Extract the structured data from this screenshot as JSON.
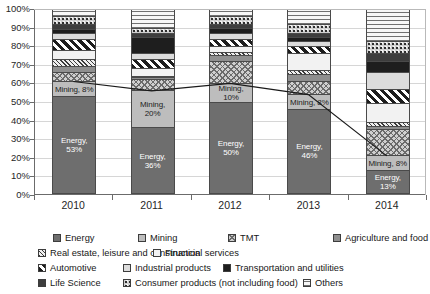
{
  "chart_data": {
    "type": "bar",
    "subtype": "100% stacked bar with trend line overlay",
    "title": "",
    "xlabel": "",
    "ylabel": "",
    "ylim": [
      0,
      100
    ],
    "ytick_labels": [
      "0%",
      "10%",
      "20%",
      "30%",
      "40%",
      "50%",
      "60%",
      "70%",
      "80%",
      "90%",
      "100%"
    ],
    "ytick_values": [
      0,
      10,
      20,
      30,
      40,
      50,
      60,
      70,
      80,
      90,
      100
    ],
    "grid": true,
    "legend_position": "bottom",
    "categories": [
      "2010",
      "2011",
      "2012",
      "2013",
      "2014"
    ],
    "series": [
      {
        "name": "Energy",
        "pattern": "solid-dark-gray",
        "values": [
          53,
          36,
          50,
          46,
          13
        ]
      },
      {
        "name": "Mining",
        "pattern": "solid-light-gray",
        "values": [
          8,
          20,
          10,
          8,
          8
        ]
      },
      {
        "name": "TMT",
        "pattern": "checkered",
        "values": [
          5,
          6,
          12,
          7,
          14
        ]
      },
      {
        "name": "Agriculture and food",
        "pattern": "solid-mid-gray",
        "values": [
          3,
          1,
          3,
          4,
          2
        ]
      },
      {
        "name": "Real estate, leisure and construction",
        "pattern": "diagonal-thin",
        "values": [
          4,
          1,
          2,
          2,
          2
        ]
      },
      {
        "name": "Financial services",
        "pattern": "solid-white",
        "values": [
          5,
          4,
          3,
          9,
          10
        ]
      },
      {
        "name": "Automotive",
        "pattern": "bold-diagonal-stripes",
        "values": [
          6,
          5,
          4,
          4,
          8
        ]
      },
      {
        "name": "Industrial products",
        "pattern": "solid-pale-gray",
        "values": [
          3,
          3,
          3,
          3,
          9
        ]
      },
      {
        "name": "Transportation and utilities",
        "pattern": "solid-black",
        "values": [
          2,
          9,
          3,
          2,
          6
        ]
      },
      {
        "name": "Life Science",
        "pattern": "solid-charcoal",
        "values": [
          3,
          2,
          2,
          2,
          4
        ]
      },
      {
        "name": "Consumer products (not including food)",
        "pattern": "dotted-grid",
        "values": [
          4,
          3,
          4,
          5,
          7
        ]
      },
      {
        "name": "Others",
        "pattern": "horizontal-lines",
        "values": [
          4,
          10,
          4,
          8,
          17
        ]
      }
    ],
    "data_labels": [
      {
        "year": "2010",
        "series": "Energy",
        "text": "Energy,\n53%"
      },
      {
        "year": "2010",
        "series": "Mining",
        "text": "Mining, 8%"
      },
      {
        "year": "2011",
        "series": "Energy",
        "text": "Energy,\n36%"
      },
      {
        "year": "2011",
        "series": "Mining",
        "text": "Mining,\n20%"
      },
      {
        "year": "2012",
        "series": "Energy",
        "text": "Energy,\n50%"
      },
      {
        "year": "2012",
        "series": "Mining",
        "text": "Mining,\n10%"
      },
      {
        "year": "2013",
        "series": "Energy",
        "text": "Energy,\n46%"
      },
      {
        "year": "2013",
        "series": "Mining",
        "text": "Mining, 8%"
      },
      {
        "year": "2014",
        "series": "Energy",
        "text": "Energy,\n13%"
      },
      {
        "year": "2014",
        "series": "Mining",
        "text": "Mining, 8%"
      }
    ],
    "trend_line": {
      "label": "",
      "color": "#1a1a1a",
      "points": [
        {
          "x": "2010",
          "y": 61
        },
        {
          "x": "2011",
          "y": 56
        },
        {
          "x": "2012",
          "y": 60
        },
        {
          "x": "2013",
          "y": 54
        },
        {
          "x": "2014",
          "y": 21
        }
      ]
    }
  },
  "legend": {
    "rows": [
      [
        {
          "label": "Energy",
          "pattern": "p-energy"
        },
        {
          "label": "Mining",
          "pattern": "p-mining"
        },
        {
          "label": "TMT",
          "pattern": "p-tmt"
        },
        {
          "label": "Agriculture and food",
          "pattern": "p-agri"
        }
      ],
      [
        {
          "label": "Real estate, leisure and construction",
          "pattern": "p-realestate"
        },
        {
          "label": "Financial services",
          "pattern": "p-financial"
        }
      ],
      [
        {
          "label": "Automotive",
          "pattern": "p-automotive"
        },
        {
          "label": "Industrial products",
          "pattern": "p-industrial"
        },
        {
          "label": "Transportation and utilities",
          "pattern": "p-transport"
        }
      ],
      [
        {
          "label": "Life Science",
          "pattern": "p-lifescience"
        },
        {
          "label": "Consumer products (not including food)",
          "pattern": "p-consumer"
        },
        {
          "label": "Others",
          "pattern": "p-others"
        }
      ]
    ]
  }
}
